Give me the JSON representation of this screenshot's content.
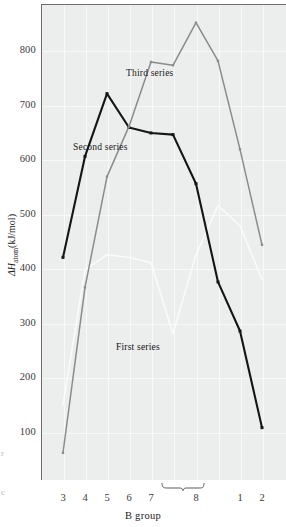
{
  "figure": {
    "background": "#ffffff",
    "plot_background": "#eceded",
    "axis_color": "#6d6d6d",
    "gridline_color": "#f7f8f8"
  },
  "axis": {
    "y_label": "ΔH",
    "y_label_sub": "atom",
    "y_label_units": "(kJ/mol)",
    "x_label": "B group",
    "y_ticks": [
      "800",
      "700",
      "600",
      "500",
      "400",
      "300",
      "200",
      "100"
    ],
    "x_ticks": [
      "3",
      "4",
      "5",
      "6",
      "7",
      "8",
      "1",
      "2"
    ],
    "brace_label": "8"
  },
  "annotations": {
    "first": "First series",
    "second": "Second series",
    "third": "Third series"
  },
  "edge_fragments": [
    "r",
    "c"
  ],
  "chart_data": {
    "type": "line",
    "title": "",
    "xlabel": "B group",
    "ylabel": "ΔHatom (kJ/mol)",
    "ylim": [
      0,
      880
    ],
    "xlim": [
      0,
      10
    ],
    "grid": true,
    "legend_position": "inline-annotations",
    "categories": [
      "3",
      "4",
      "5",
      "6",
      "7",
      "8a",
      "8b",
      "8c",
      "1",
      "2"
    ],
    "category_tick_labels": [
      "3",
      "4",
      "5",
      "6",
      "7",
      "",
      "8",
      "",
      "1",
      "2"
    ],
    "series": [
      {
        "name": "First series",
        "color": "#fbfbfb",
        "marker": "none",
        "x": [
          "3",
          "4",
          "5",
          "6",
          "7",
          "8a",
          "8b",
          "8c",
          "1",
          "2"
        ],
        "values": [
          150,
          397,
          425,
          420,
          410,
          280,
          425,
          515,
          478,
          380
        ]
      },
      {
        "name": "Second series",
        "color": "#151515",
        "marker": "square",
        "x": [
          "3",
          "4",
          "5",
          "6",
          "7",
          "8a",
          "8b",
          "8c",
          "1",
          "2"
        ],
        "values": [
          420,
          605,
          720,
          658,
          648,
          645,
          555,
          375,
          285,
          108
        ]
      },
      {
        "name": "Third series",
        "color": "#8b8b8b",
        "marker": "square",
        "x": [
          "3",
          "4",
          "5",
          "6",
          "7",
          "8a",
          "8b",
          "8c",
          "1",
          "2"
        ],
        "values": [
          62,
          365,
          568,
          660,
          778,
          772,
          850,
          780,
          618,
          443
        ]
      }
    ]
  },
  "geometry": {
    "plot": {
      "left": 41,
      "top": 4,
      "width": 245,
      "height": 476
    },
    "x_positions_px": [
      63,
      85,
      107,
      129,
      151,
      173,
      196,
      218,
      240,
      262
    ],
    "y_for_800_px": 50,
    "y_for_100_px": 432
  }
}
